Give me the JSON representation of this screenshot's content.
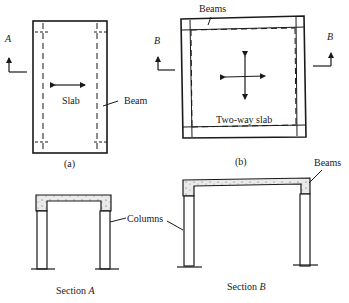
{
  "figure": {
    "panel_a": {
      "caption": "(a)",
      "slab_label": "Slab",
      "beam_label": "Beam",
      "section_marker": "A"
    },
    "panel_b": {
      "caption": "(b)",
      "slab_label": "Two-way slab",
      "beams_label": "Beams",
      "section_marker_left": "B",
      "section_marker_right": "B"
    },
    "section_a": {
      "title_prefix": "Section ",
      "title_letter": "A"
    },
    "section_b": {
      "title_prefix": "Section ",
      "title_letter": "B",
      "beams_label": "Beams"
    },
    "columns_label": "Columns"
  },
  "colors": {
    "ink": "#1a1a1a",
    "concrete": "#e6e6e6"
  }
}
